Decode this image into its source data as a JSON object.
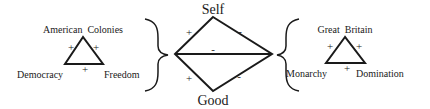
{
  "center_diamond": {
    "top_label": "Self",
    "bottom_label": "Good",
    "signs": {
      "upper_left": "+",
      "upper_right": "-",
      "middle": "-",
      "lower_left": "+",
      "lower_right": "-"
    }
  },
  "left_triangle": {
    "title": "American  Colonies",
    "bottom_left_label": "Democracy",
    "bottom_right_label": "Freedom",
    "signs": {
      "left_edge": "+",
      "right_edge": "+",
      "base": "+"
    }
  },
  "right_triangle": {
    "title": "Great  Britain",
    "bottom_left_label": "Monarchy",
    "bottom_right_label": "Domination",
    "signs": {
      "left_edge": "+",
      "right_edge": "+",
      "base": "+"
    }
  },
  "colors": {
    "ink": "#1a1a1a",
    "background": "#ffffff"
  }
}
